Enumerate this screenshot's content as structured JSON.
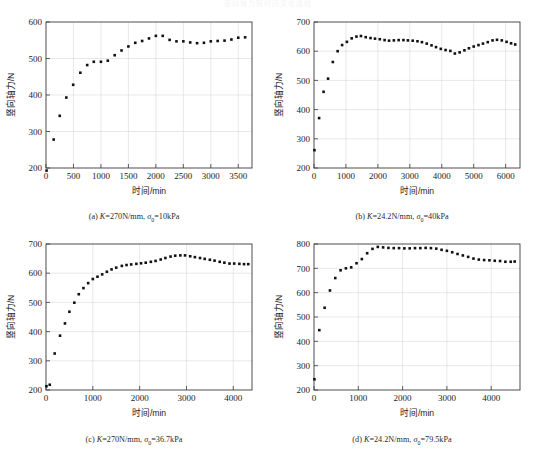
{
  "header": {
    "cut_text": "竖向轴力随时间变化曲线"
  },
  "figure": {
    "panels": [
      {
        "id": "a",
        "caption": "(a) K=270N/mm, σ₀=10kPa",
        "caption_prefix": "(a) ",
        "caption_k": "K",
        "caption_mid": "=270N/mm, ",
        "caption_sigma": "σ",
        "caption_sub": "0",
        "caption_tail": "=10kPa"
      },
      {
        "id": "b",
        "caption": "(b) K=24.2N/mm, σ₀=40kPa",
        "caption_prefix": "(b) ",
        "caption_k": "K",
        "caption_mid": "=24.2N/mm, ",
        "caption_sigma": "σ",
        "caption_sub": "0",
        "caption_tail": "=40kPa"
      },
      {
        "id": "c",
        "caption": "(c) K=270N/mm, σ₀=36.7kPa",
        "caption_prefix": "(c) ",
        "caption_k": "K",
        "caption_mid": "=270N/mm, ",
        "caption_sigma": "σ",
        "caption_sub": "0",
        "caption_tail": "=36.7kPa"
      },
      {
        "id": "d",
        "caption": "(d) K=24.2N/mm, σ₀=79.5kPa",
        "caption_prefix": "(d) ",
        "caption_k": "K",
        "caption_mid": "=24.2N/mm, ",
        "caption_sigma": "σ",
        "caption_sub": "0",
        "caption_tail": "=79.5kPa"
      }
    ]
  },
  "chart_data": [
    {
      "type": "scatter",
      "panel": "a",
      "title": "",
      "xlabel": "时间/min",
      "ylabel": "竖向轴力/N",
      "xlim": [
        0,
        3750
      ],
      "ylim": [
        200,
        600
      ],
      "xticks": [
        0,
        500,
        1000,
        1500,
        2000,
        2500,
        3000,
        3500
      ],
      "yticks": [
        200,
        300,
        400,
        500,
        600
      ],
      "grid": true,
      "marker": "square",
      "color": "#111111",
      "x": [
        10,
        140,
        250,
        370,
        495,
        625,
        750,
        870,
        1000,
        1125,
        1250,
        1375,
        1500,
        1625,
        1750,
        1875,
        2000,
        2125,
        2250,
        2375,
        2500,
        2625,
        2750,
        2875,
        3000,
        3125,
        3250,
        3375,
        3500,
        3625
      ],
      "y": [
        193,
        278,
        343,
        393,
        428,
        461,
        482,
        491,
        491,
        494,
        509,
        522,
        533,
        543,
        548,
        555,
        562,
        562,
        551,
        547,
        547,
        544,
        542,
        543,
        547,
        548,
        549,
        552,
        557,
        558
      ]
    },
    {
      "type": "scatter",
      "panel": "b",
      "title": "",
      "xlabel": "时间/min",
      "ylabel": "竖向轴力/N",
      "xlim": [
        0,
        6450
      ],
      "ylim": [
        200,
        700
      ],
      "xticks": [
        0,
        1000,
        2000,
        3000,
        4000,
        5000,
        6000
      ],
      "yticks": [
        200,
        300,
        400,
        500,
        600,
        700
      ],
      "grid": true,
      "marker": "square",
      "color": "#111111",
      "x": [
        15,
        160,
        300,
        440,
        590,
        740,
        880,
        1030,
        1180,
        1330,
        1470,
        1620,
        1770,
        1910,
        2060,
        2210,
        2350,
        2500,
        2650,
        2800,
        2940,
        3090,
        3240,
        3380,
        3530,
        3680,
        3820,
        3970,
        4120,
        4270,
        4410,
        4560,
        4710,
        4850,
        5000,
        5150,
        5290,
        5440,
        5590,
        5730,
        5880,
        6030,
        6170,
        6300
      ],
      "y": [
        261,
        371,
        461,
        506,
        563,
        600,
        621,
        632,
        644,
        650,
        652,
        648,
        645,
        643,
        641,
        638,
        636,
        637,
        638,
        638,
        637,
        636,
        634,
        631,
        626,
        620,
        614,
        608,
        604,
        601,
        592,
        596,
        603,
        610,
        616,
        621,
        626,
        631,
        637,
        639,
        637,
        632,
        627,
        623
      ]
    },
    {
      "type": "scatter",
      "panel": "c",
      "title": "",
      "xlabel": "时间/min",
      "ylabel": "竖向轴力/N",
      "xlim": [
        0,
        4400
      ],
      "ylim": [
        200,
        700
      ],
      "xticks": [
        0,
        1000,
        2000,
        3000,
        4000
      ],
      "yticks": [
        200,
        300,
        400,
        500,
        600,
        700
      ],
      "grid": true,
      "marker": "square",
      "color": "#111111",
      "x": [
        10,
        80,
        185,
        300,
        405,
        500,
        605,
        700,
        800,
        900,
        1000,
        1100,
        1200,
        1300,
        1400,
        1500,
        1620,
        1720,
        1820,
        1930,
        2030,
        2130,
        2240,
        2340,
        2450,
        2550,
        2660,
        2760,
        2870,
        2970,
        3080,
        3180,
        3290,
        3390,
        3500,
        3600,
        3710,
        3810,
        3920,
        4020,
        4130,
        4230,
        4320
      ],
      "y": [
        213,
        218,
        325,
        386,
        428,
        468,
        499,
        528,
        549,
        566,
        580,
        588,
        596,
        605,
        613,
        619,
        625,
        628,
        630,
        632,
        634,
        636,
        639,
        642,
        647,
        652,
        657,
        660,
        661,
        661,
        658,
        655,
        652,
        649,
        646,
        643,
        639,
        636,
        633,
        633,
        632,
        631,
        631
      ]
    },
    {
      "type": "scatter",
      "panel": "d",
      "title": "",
      "xlabel": "时间/min",
      "ylabel": "竖向轴力/N",
      "xlim": [
        0,
        4650
      ],
      "ylim": [
        200,
        800
      ],
      "xticks": [
        0,
        1000,
        2000,
        3000,
        4000
      ],
      "yticks": [
        200,
        300,
        400,
        500,
        600,
        700,
        800
      ],
      "grid": true,
      "marker": "square",
      "color": "#111111",
      "x": [
        10,
        120,
        240,
        360,
        480,
        600,
        720,
        840,
        960,
        1080,
        1200,
        1320,
        1440,
        1560,
        1680,
        1800,
        1920,
        2040,
        2160,
        2280,
        2400,
        2520,
        2640,
        2760,
        2880,
        3000,
        3120,
        3240,
        3360,
        3480,
        3600,
        3720,
        3840,
        3960,
        4080,
        4200,
        4320,
        4440,
        4530
      ],
      "y": [
        244,
        446,
        538,
        609,
        660,
        692,
        700,
        704,
        721,
        738,
        762,
        780,
        788,
        786,
        784,
        783,
        783,
        782,
        782,
        783,
        783,
        784,
        783,
        781,
        776,
        772,
        766,
        759,
        753,
        747,
        740,
        736,
        734,
        733,
        731,
        730,
        727,
        727,
        728
      ]
    }
  ]
}
